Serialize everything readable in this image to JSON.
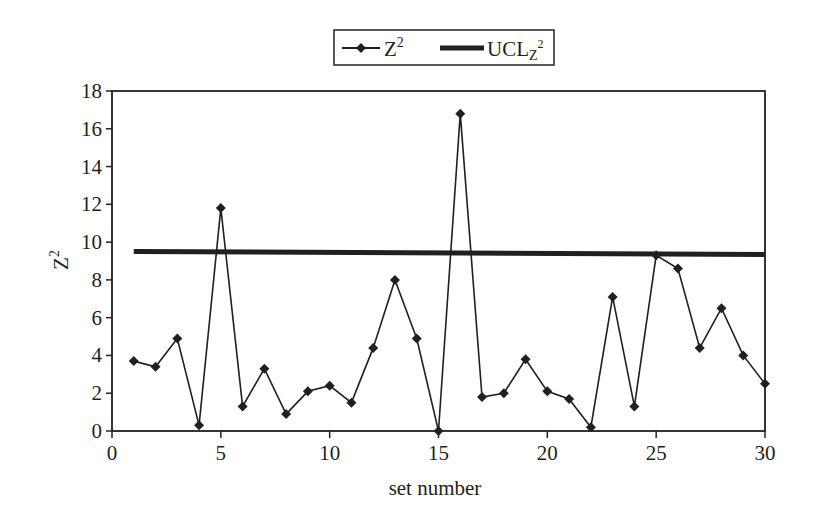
{
  "chart_data": {
    "type": "line",
    "title": "",
    "xlabel": "set number",
    "ylabel": "Z²",
    "xlim": [
      0,
      30
    ],
    "ylim": [
      0,
      18
    ],
    "x_ticks": [
      "0",
      "5",
      "10",
      "15",
      "20",
      "25",
      "30"
    ],
    "y_ticks": [
      "0",
      "2",
      "4",
      "6",
      "8",
      "10",
      "12",
      "14",
      "16",
      "18"
    ],
    "grid": false,
    "legend_position": "top-center",
    "legend": [
      "Z²",
      "UCL_Z²"
    ],
    "x": [
      1,
      2,
      3,
      4,
      5,
      6,
      7,
      8,
      9,
      10,
      11,
      12,
      13,
      14,
      15,
      16,
      17,
      18,
      19,
      20,
      21,
      22,
      23,
      24,
      25,
      26,
      27,
      28,
      29,
      30
    ],
    "series": [
      {
        "name": "Z²",
        "style": "line with diamond markers",
        "values": [
          3.7,
          3.4,
          4.9,
          0.3,
          11.8,
          1.3,
          3.3,
          0.9,
          2.1,
          2.4,
          1.5,
          4.4,
          8.0,
          4.9,
          0.0,
          16.8,
          1.8,
          2.0,
          3.8,
          2.1,
          1.7,
          0.2,
          7.1,
          1.3,
          9.3,
          8.6,
          4.4,
          6.5,
          4.0,
          2.5
        ]
      },
      {
        "name": "UCL_Z²",
        "style": "thick line",
        "x": [
          1,
          30
        ],
        "values": [
          9.5,
          9.35
        ]
      }
    ]
  },
  "legend": {
    "item1_base": "Z",
    "item1_sup": "2",
    "item2_base": "UCL",
    "item2_sub": "Z",
    "item2_sup": "2"
  },
  "axes": {
    "xlabel": "set number",
    "ylabel_base": "Z",
    "ylabel_sup": "2"
  },
  "colors": {
    "ink": "#231f20",
    "background": "#ffffff"
  }
}
